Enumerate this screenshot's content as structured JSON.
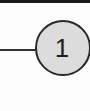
{
  "diagram": {
    "node": {
      "label": "1",
      "fill": "#dcdcdc",
      "stroke": "#2a2a2a"
    },
    "connector": {
      "color": "#333333"
    },
    "top_band": {
      "color": "#1a1a1a"
    }
  }
}
